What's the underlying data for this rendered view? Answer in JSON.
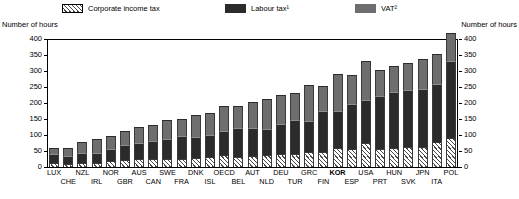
{
  "legend": {
    "items": [
      {
        "label": "Corporate income tax",
        "icon": "hatched-swatch-icon",
        "color": "#ffffff"
      },
      {
        "label": "Labour tax¹",
        "icon": "dark-swatch-icon",
        "color": "#2b2b2b"
      },
      {
        "label": "VAT²",
        "icon": "gray-swatch-icon",
        "color": "#6e6e6e"
      }
    ]
  },
  "axis_titles": {
    "left": "Number of hours",
    "right": "Number of hours"
  },
  "chart_data": {
    "type": "bar",
    "subtype": "stacked-column",
    "title": "",
    "xlabel": "",
    "ylabel": "Number of hours",
    "ylim": [
      0,
      400
    ],
    "yticks": [
      0,
      50,
      100,
      150,
      200,
      250,
      300,
      350,
      400
    ],
    "grid": false,
    "legend_position": "top",
    "dual_axis": true,
    "highlighted_category": "KOR",
    "categories": [
      "LUX",
      "CHE",
      "NZL",
      "IRL",
      "NOR",
      "GBR",
      "AUS",
      "CAN",
      "SWE",
      "FRA",
      "DNK",
      "ISL",
      "OECD",
      "BEL",
      "AUT",
      "NLD",
      "DEU",
      "TUR",
      "GRC",
      "FIN",
      "KOR",
      "ESP",
      "USA",
      "PRT",
      "HUN",
      "SVK",
      "JPN",
      "ITA",
      "POL"
    ],
    "series": [
      {
        "name": "Corporate income tax",
        "color": "#ffffff",
        "pattern": "diagonal-hatch",
        "values": [
          14,
          10,
          12,
          14,
          18,
          22,
          24,
          26,
          26,
          26,
          28,
          30,
          36,
          30,
          34,
          36,
          40,
          40,
          48,
          46,
          60,
          56,
          76,
          56,
          60,
          62,
          62,
          78,
          90
        ]
      },
      {
        "name": "Labour tax¹",
        "color": "#2b2b2b",
        "values": [
          26,
          24,
          32,
          30,
          38,
          46,
          52,
          54,
          62,
          70,
          66,
          70,
          78,
          92,
          88,
          84,
          94,
          108,
          96,
          128,
          116,
          140,
          132,
          166,
          174,
          180,
          182,
          180,
          240
        ]
      },
      {
        "name": "VAT²",
        "color": "#6e6e6e",
        "values": [
          18,
          26,
          34,
          42,
          42,
          44,
          48,
          50,
          58,
          54,
          68,
          68,
          76,
          70,
          82,
          92,
          90,
          82,
          112,
          78,
          116,
          92,
          122,
          80,
          82,
          82,
          92,
          96,
          90
        ]
      }
    ],
    "totals": [
      58,
      60,
      78,
      86,
      98,
      112,
      124,
      130,
      146,
      150,
      162,
      168,
      190,
      192,
      204,
      212,
      224,
      230,
      256,
      252,
      292,
      288,
      330,
      302,
      316,
      324,
      336,
      354,
      420
    ]
  }
}
